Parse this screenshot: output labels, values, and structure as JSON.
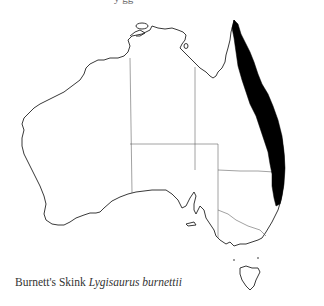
{
  "map": {
    "title_fragment": "y  gg",
    "region": "Australia",
    "colors": {
      "background": "#ffffff",
      "coastline": "#222222",
      "state_borders": "#555555",
      "range_fill": "#000000"
    },
    "shaded_range": "East coast of Queensland from Cape York south to northern New South Wales"
  },
  "caption": {
    "common_name": "Burnett's Skink",
    "scientific_name": "Lygisaurus burnettii"
  }
}
